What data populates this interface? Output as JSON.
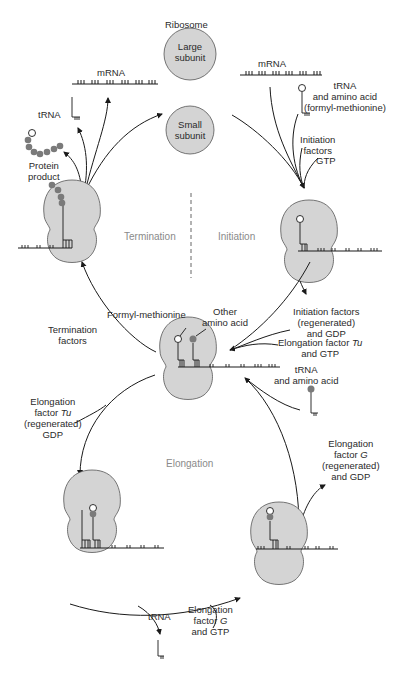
{
  "diagram": {
    "phases": {
      "termination": "Termination",
      "initiation": "Initiation",
      "elongation": "Elongation"
    },
    "ribosome": {
      "label": "Ribosome",
      "large": [
        "Large",
        "subunit"
      ],
      "small": [
        "Small",
        "subunit"
      ]
    },
    "labels": {
      "mrna_left": "mRNA",
      "mrna_right": "mRNA",
      "trna_left": "tRNA",
      "protein_product": [
        "Protein",
        "product"
      ],
      "trna_aa_fmet": [
        "tRNA",
        "and amino acid",
        "(formyl-methionine)"
      ],
      "initiation_factors": [
        "Initiation",
        "factors"
      ],
      "gtp": "GTP",
      "termination_factors": [
        "Termination",
        "factors"
      ],
      "formyl_methionine": "Formyl-methionine",
      "other_amino_acid": [
        "Other",
        "amino acid"
      ],
      "init_factors_regen": [
        "Initiation factors",
        "(regenerated)",
        "and GDP"
      ],
      "ef_tu_gtp": [
        "Elongation factor Tu",
        "and GTP"
      ],
      "trna_aa": [
        "tRNA",
        "and amino acid"
      ],
      "ef_tu_regen": [
        "Elongation",
        "factor Tu",
        "(regenerated)",
        "GDP"
      ],
      "ef_g_regen": [
        "Elongation",
        "factor G",
        "(regenerated)",
        "and GDP"
      ],
      "trna_bottom": "tRNA",
      "ef_g_gtp": [
        "Elongation",
        "factor G",
        "and GTP"
      ]
    },
    "colors": {
      "ribosome_fill": "#d4d4d4",
      "amino_acid": "#7a7a7a",
      "line": "#1a1a1a",
      "phase_text": "#8a8a8a"
    }
  }
}
